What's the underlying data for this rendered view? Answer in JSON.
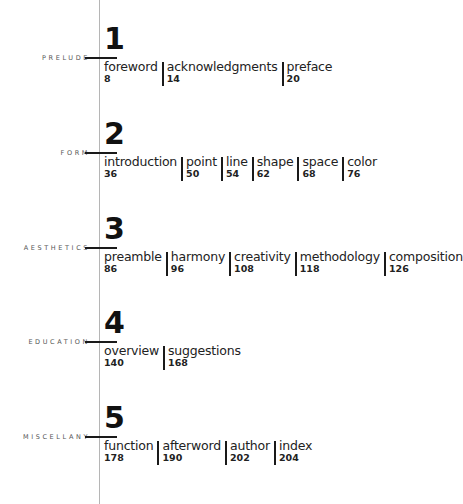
{
  "sections": [
    {
      "number": "1",
      "label": "PRELUDE",
      "entries": [
        {
          "title": "foreword",
          "page": "8"
        },
        {
          "title": "acknowledgments",
          "page": "14"
        },
        {
          "title": "preface",
          "page": "20"
        }
      ]
    },
    {
      "number": "2",
      "label": "FORM",
      "entries": [
        {
          "title": "introduction",
          "page": "36"
        },
        {
          "title": "point",
          "page": "50"
        },
        {
          "title": "line",
          "page": "54"
        },
        {
          "title": "shape",
          "page": "62"
        },
        {
          "title": "space",
          "page": "68"
        },
        {
          "title": "color",
          "page": "76"
        }
      ]
    },
    {
      "number": "3",
      "label": "AESTHETICS",
      "entries": [
        {
          "title": "preamble",
          "page": "86"
        },
        {
          "title": "harmony",
          "page": "96"
        },
        {
          "title": "creativity",
          "page": "108"
        },
        {
          "title": "methodology",
          "page": "118"
        },
        {
          "title": "composition",
          "page": "126"
        }
      ]
    },
    {
      "number": "4",
      "label": "EDUCATION",
      "entries": [
        {
          "title": "overview",
          "page": "140"
        },
        {
          "title": "suggestions",
          "page": "168"
        }
      ]
    },
    {
      "number": "5",
      "label": "MISCELLANY",
      "entries": [
        {
          "title": "function",
          "page": "178"
        },
        {
          "title": "afterword",
          "page": "190"
        },
        {
          "title": "author",
          "page": "202"
        },
        {
          "title": "index",
          "page": "204"
        }
      ]
    }
  ]
}
